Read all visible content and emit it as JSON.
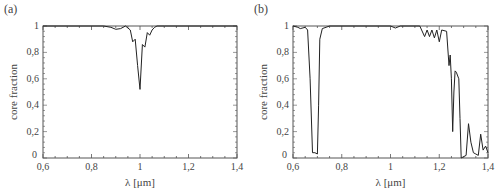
{
  "chart_data": [
    {
      "panel_label": "(a)",
      "type": "line",
      "title": "",
      "xlabel": "λ [μm]",
      "ylabel": "core fraction",
      "xlim": [
        0.6,
        1.4
      ],
      "ylim": [
        0,
        1
      ],
      "xticks": [
        "0,6",
        "0,8",
        "1",
        "1,2",
        "1,4"
      ],
      "yticks": [
        "0",
        "0,2",
        "0,4",
        "0,6",
        "0,8",
        "1"
      ],
      "grid": false,
      "legend": null,
      "x": [
        0.6,
        0.85,
        0.88,
        0.9,
        0.92,
        0.94,
        0.96,
        0.97,
        0.98,
        0.99,
        1.0,
        1.01,
        1.02,
        1.03,
        1.04,
        1.05,
        1.06,
        1.07,
        1.1,
        1.4
      ],
      "y": [
        1.0,
        1.0,
        0.99,
        0.975,
        0.98,
        1.0,
        0.97,
        0.88,
        0.9,
        0.7,
        0.52,
        0.86,
        0.84,
        0.95,
        0.93,
        0.97,
        0.99,
        1.0,
        1.0,
        1.0
      ]
    },
    {
      "panel_label": "(b)",
      "type": "line",
      "title": "",
      "xlabel": "λ [μm]",
      "ylabel": "core fraction",
      "xlim": [
        0.6,
        1.4
      ],
      "ylim": [
        0,
        1
      ],
      "xticks": [
        "0,6",
        "0,8",
        "1",
        "1,2",
        "1,4"
      ],
      "yticks": [
        "0",
        "0,2",
        "0,4",
        "0,6",
        "0,8",
        "1"
      ],
      "grid": false,
      "legend": null,
      "x": [
        0.6,
        0.62,
        0.63,
        0.65,
        0.66,
        0.67,
        0.68,
        0.69,
        0.7,
        0.705,
        0.71,
        0.72,
        0.75,
        1.0,
        1.02,
        1.04,
        1.12,
        1.14,
        1.15,
        1.16,
        1.17,
        1.18,
        1.19,
        1.2,
        1.21,
        1.23,
        1.24,
        1.245,
        1.25,
        1.255,
        1.26,
        1.265,
        1.27,
        1.28,
        1.285,
        1.29,
        1.3,
        1.31,
        1.32,
        1.33,
        1.34,
        1.35,
        1.36,
        1.37,
        1.38,
        1.39,
        1.4
      ],
      "y": [
        1.0,
        0.99,
        0.98,
        0.99,
        0.97,
        0.6,
        0.04,
        0.04,
        0.03,
        0.4,
        0.9,
        0.98,
        1.0,
        1.0,
        0.985,
        1.0,
        1.0,
        0.92,
        0.97,
        0.92,
        0.97,
        0.91,
        0.97,
        0.88,
        0.97,
        0.96,
        0.7,
        0.78,
        0.6,
        0.2,
        0.5,
        0.66,
        0.65,
        0.6,
        0.3,
        0.0,
        0.01,
        0.02,
        0.26,
        0.12,
        0.04,
        0.03,
        0.02,
        0.18,
        0.06,
        0.09,
        0.04
      ]
    }
  ]
}
